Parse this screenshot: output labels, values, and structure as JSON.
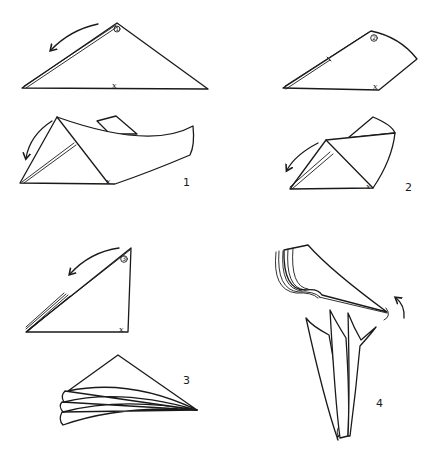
{
  "diagram": {
    "steps": [
      {
        "id": 1,
        "label": "1",
        "circled_marker": "1",
        "corner_mark": "x"
      },
      {
        "id": 2,
        "label": "2",
        "circled_marker": "2",
        "corner_mark": "x"
      },
      {
        "id": 3,
        "label": "3",
        "circled_marker": "3",
        "corner_mark": "x"
      },
      {
        "id": 4,
        "label": "4"
      }
    ],
    "colors": {
      "line": "#1a1a1a",
      "background": "#ffffff"
    }
  }
}
